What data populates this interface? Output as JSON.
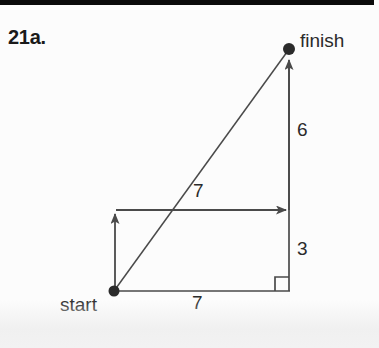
{
  "problem": {
    "number_label": "21a."
  },
  "figure": {
    "type": "vector-right-triangle",
    "points": [
      {
        "name": "start",
        "label": "start",
        "x": 114,
        "y": 291
      },
      {
        "name": "finish",
        "label": "finish",
        "x": 289,
        "y": 49
      }
    ],
    "vectors": [
      {
        "name": "horizontal-component",
        "label": "7",
        "direction": "right",
        "from": [
          115,
          210
        ],
        "to": [
          289,
          210
        ]
      },
      {
        "name": "vertical-component-lower",
        "label": "",
        "direction": "up",
        "from": [
          115,
          291
        ],
        "to": [
          115,
          210
        ]
      },
      {
        "name": "vertical-component-upper",
        "label": "",
        "direction": "up",
        "from": [
          289,
          210
        ],
        "to": [
          289,
          56
        ]
      },
      {
        "name": "resultant-diagonal",
        "label": "7",
        "direction": "up-right",
        "from": [
          114,
          291
        ],
        "to": [
          289,
          49
        ]
      }
    ],
    "segments": [
      {
        "name": "base-segment",
        "label": "7",
        "from": [
          115,
          291
        ],
        "to": [
          289,
          291
        ]
      },
      {
        "name": "right-side-upper",
        "label": "6",
        "from": [
          289,
          56
        ],
        "to": [
          289,
          210
        ]
      },
      {
        "name": "right-side-lower",
        "label": "3",
        "from": [
          289,
          210
        ],
        "to": [
          289,
          291
        ]
      }
    ],
    "right_angle_marker": {
      "name": "right-angle-square",
      "x": 275,
      "y": 277,
      "size": 14
    },
    "labels": {
      "finish": "finish",
      "start": "start",
      "six": "6",
      "three": "3",
      "seven_diagonal": "7",
      "seven_base": "7"
    }
  },
  "colors": {
    "ink": "#4a4a4a",
    "ink_dark": "#2b2b2b",
    "page_background": "#fcfcfc",
    "scan_bar": "#0b0b0b"
  }
}
